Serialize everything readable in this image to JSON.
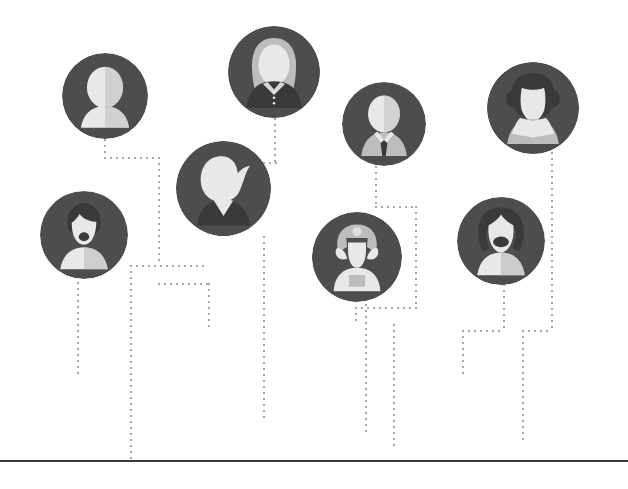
{
  "diagram": {
    "background_color": "#ffffff",
    "circle_color": "#4d4d4d",
    "figure_light": "#e8e8e8",
    "figure_mid": "#bdbdbd",
    "figure_dark": "#3a3a3a",
    "connector_color": "#a8a8a8",
    "baseline_color": "#3a3a3a",
    "connector_style": "dotted"
  },
  "nodes": [
    {
      "id": "node-1",
      "label": "person-generic-silhouette",
      "icon": "user-silhouette-icon",
      "description": "Generic headshot silhouette, no hair detail",
      "x": 62,
      "y": 53,
      "size": 86
    },
    {
      "id": "node-2",
      "label": "person-long-hair-blouse",
      "icon": "user-long-hair-icon",
      "description": "Woman with long hair and dark buttoned blouse",
      "x": 228,
      "y": 26,
      "size": 92
    },
    {
      "id": "node-3",
      "label": "person-bearded-man",
      "icon": "user-beard-icon",
      "description": "Man with dark hair and full beard",
      "x": 40,
      "y": 191,
      "size": 88
    },
    {
      "id": "node-4",
      "label": "person-quiff-hair",
      "icon": "user-quiff-icon",
      "description": "Person with swept hair curl and dark v-neck top",
      "x": 176,
      "y": 141,
      "size": 95
    },
    {
      "id": "node-5",
      "label": "person-suit-and-tie",
      "icon": "user-tie-icon",
      "description": "Man in light suit with dark necktie",
      "x": 342,
      "y": 82,
      "size": 84
    },
    {
      "id": "node-6",
      "label": "person-curly-hair",
      "icon": "user-curly-hair-icon",
      "description": "Person with curly hair and open collar shirt",
      "x": 487,
      "y": 62,
      "size": 92
    },
    {
      "id": "node-7",
      "label": "person-pigtails",
      "icon": "user-pigtails-icon",
      "description": "Figure with side hair wings and light torso",
      "x": 312,
      "y": 212,
      "size": 90
    },
    {
      "id": "node-8",
      "label": "person-bob-hair",
      "icon": "user-bob-hair-icon",
      "description": "Woman with bob hairstyle framing the face",
      "x": 457,
      "y": 197,
      "size": 88
    }
  ],
  "connectors": [
    {
      "id": "c1",
      "orientation": "vertical",
      "from_node": "node-1",
      "x": 104,
      "y": 139,
      "length": 18
    },
    {
      "id": "c2",
      "orientation": "horizontal",
      "x": 104,
      "y": 157,
      "length": 56
    },
    {
      "id": "c3",
      "orientation": "vertical",
      "x": 158,
      "y": 157,
      "length": 108
    },
    {
      "id": "c4",
      "orientation": "horizontal",
      "x": 130,
      "y": 265,
      "length": 78
    },
    {
      "id": "c5",
      "orientation": "vertical",
      "from_node": "node-3",
      "x": 77,
      "y": 282,
      "length": 96
    },
    {
      "id": "c6",
      "orientation": "vertical",
      "x": 130,
      "y": 265,
      "length": 197
    },
    {
      "id": "c7",
      "orientation": "horizontal",
      "x": 158,
      "y": 283,
      "length": 52
    },
    {
      "id": "c8",
      "orientation": "vertical",
      "x": 208,
      "y": 283,
      "length": 48
    },
    {
      "id": "c9",
      "orientation": "vertical",
      "from_node": "node-4",
      "x": 263,
      "y": 236,
      "length": 186
    },
    {
      "id": "c10",
      "orientation": "vertical",
      "from_node": "node-2",
      "x": 274,
      "y": 118,
      "length": 44
    },
    {
      "id": "c11",
      "orientation": "horizontal",
      "x": 263,
      "y": 162,
      "length": 16
    },
    {
      "id": "c12",
      "orientation": "vertical",
      "from_node": "node-5",
      "x": 375,
      "y": 166,
      "length": 42
    },
    {
      "id": "c13",
      "orientation": "horizontal",
      "x": 375,
      "y": 206,
      "length": 42
    },
    {
      "id": "c14",
      "orientation": "vertical",
      "x": 415,
      "y": 206,
      "length": 101
    },
    {
      "id": "c15",
      "orientation": "horizontal",
      "x": 355,
      "y": 307,
      "length": 62
    },
    {
      "id": "c16",
      "orientation": "vertical",
      "x": 355,
      "y": 307,
      "length": 17
    },
    {
      "id": "c17",
      "orientation": "vertical",
      "from_node": "node-7",
      "x": 365,
      "y": 298,
      "length": 137
    },
    {
      "id": "c18",
      "orientation": "vertical",
      "x": 393,
      "y": 324,
      "length": 122
    },
    {
      "id": "c19",
      "orientation": "vertical",
      "from_node": "node-8",
      "x": 503,
      "y": 284,
      "length": 46
    },
    {
      "id": "c20",
      "orientation": "horizontal",
      "x": 462,
      "y": 330,
      "length": 42
    },
    {
      "id": "c21",
      "orientation": "vertical",
      "x": 462,
      "y": 330,
      "length": 44
    },
    {
      "id": "c22",
      "orientation": "vertical",
      "from_node": "node-6",
      "x": 551,
      "y": 152,
      "length": 178
    },
    {
      "id": "c23",
      "orientation": "horizontal",
      "x": 522,
      "y": 330,
      "length": 30
    },
    {
      "id": "c24",
      "orientation": "vertical",
      "x": 522,
      "y": 330,
      "length": 110
    }
  ],
  "baseline": {
    "label": "ground-baseline",
    "x": 0,
    "y": 460,
    "width": 628
  }
}
